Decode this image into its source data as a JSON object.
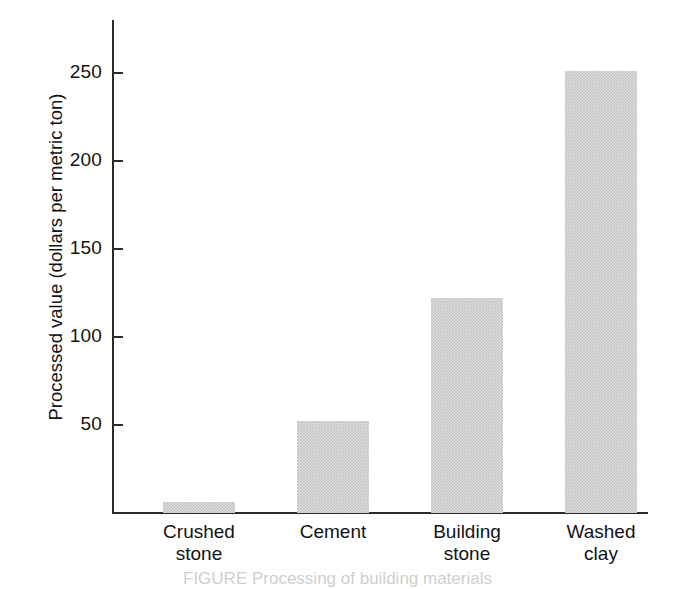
{
  "chart_data": {
    "type": "bar",
    "title": "",
    "xlabel": "",
    "ylabel": "Processed value (dollars per metric ton)",
    "categories": [
      "Crushed stone",
      "Cement",
      "Building stone",
      "Washed clay"
    ],
    "category_lines": [
      [
        "Crushed",
        "stone"
      ],
      [
        "Cement",
        ""
      ],
      [
        "Building",
        "stone"
      ],
      [
        "Washed",
        "clay"
      ]
    ],
    "values": [
      6,
      52,
      122,
      251
    ],
    "ylim": [
      0,
      280
    ],
    "yticks": [
      50,
      100,
      150,
      200,
      250
    ],
    "ytick_labels": [
      "50",
      "100",
      "150",
      "200",
      "250"
    ],
    "grid": false,
    "legend": false,
    "bar_fill": "#c9c9c9",
    "axis_color": "#2b2b2b",
    "units": "dollars per metric ton"
  },
  "caption": {
    "figure_word": "FIGURE",
    "text": "FIGURE   Processing of building materials"
  }
}
